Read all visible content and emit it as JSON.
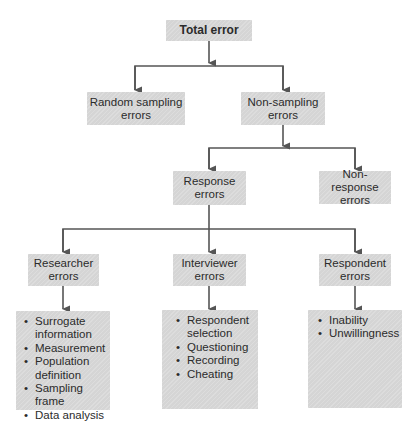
{
  "diagram": {
    "type": "hierarchy",
    "colors": {
      "box_fill": "#d5d5d5",
      "line": "#555555",
      "text": "#2b2b2b"
    },
    "root": {
      "label": "Total error"
    },
    "level1": [
      {
        "label": "Random sampling errors",
        "line1": "Random sampling",
        "line2": "errors"
      },
      {
        "label": "Non-sampling errors",
        "line1": "Non-sampling",
        "line2": "errors"
      }
    ],
    "level2": [
      {
        "label": "Response errors",
        "line1": "Response",
        "line2": "errors"
      },
      {
        "label": "Non-response errors",
        "line1": "Non-response",
        "line2": "errors"
      }
    ],
    "level3": [
      {
        "line1": "Researcher",
        "line2": "errors",
        "items": [
          "Surrogate information",
          "Measurement",
          "Population definition",
          "Sampling frame",
          "Data analysis"
        ]
      },
      {
        "line1": "Interviewer",
        "line2": "errors",
        "items": [
          "Respondent selection",
          "Questioning",
          "Recording",
          "Cheating"
        ]
      },
      {
        "line1": "Respondent",
        "line2": "errors",
        "items": [
          "Inability",
          "Unwillingness"
        ]
      }
    ]
  }
}
